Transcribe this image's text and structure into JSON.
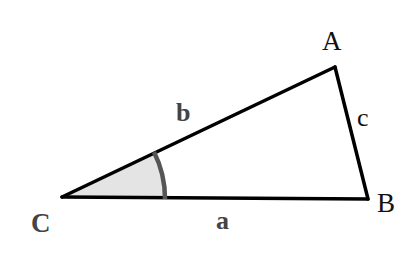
{
  "diagram": {
    "type": "triangle",
    "vertices": {
      "A": {
        "label": "A",
        "x": 335,
        "y": 67
      },
      "B": {
        "label": "B",
        "x": 368,
        "y": 199
      },
      "C": {
        "label": "C",
        "x": 62,
        "y": 197
      }
    },
    "sides": {
      "a": {
        "label": "a",
        "from": "C",
        "to": "B"
      },
      "b": {
        "label": "b",
        "from": "C",
        "to": "A"
      },
      "c": {
        "label": "c",
        "from": "A",
        "to": "B"
      }
    },
    "angle_marker": {
      "vertex": "C",
      "fill": "#e4e4e4",
      "stroke": "#555555"
    },
    "colors": {
      "edge": "#000000",
      "vertex_label": "#111111",
      "vertex_label_C": "#444444",
      "side_label_bold": "#444444",
      "side_label_c": "#111111"
    }
  }
}
